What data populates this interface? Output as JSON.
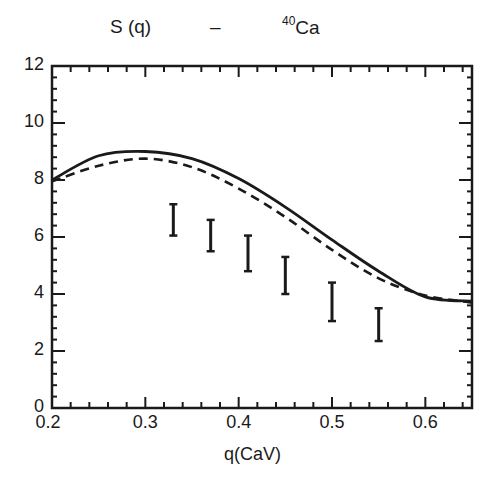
{
  "chart_data": {
    "type": "line",
    "title": "S (q)   –   40Ca",
    "title_parts": {
      "quantity": "S (q)",
      "dash": "–",
      "mass_number": "40",
      "element": "Ca"
    },
    "xlabel": "q(CaV)",
    "ylabel": "",
    "xlim": [
      0.2,
      0.65
    ],
    "ylim": [
      0,
      12
    ],
    "x_ticks": [
      "0.2",
      "0.3",
      "0.4",
      "0.5",
      "0.6"
    ],
    "y_ticks": [
      "0",
      "2",
      "4",
      "6",
      "8",
      "10",
      "12"
    ],
    "grid": false,
    "legend": "none",
    "series": [
      {
        "name": "solid curve",
        "style": "solid",
        "x": [
          0.2,
          0.25,
          0.3,
          0.35,
          0.4,
          0.45,
          0.5,
          0.55,
          0.6,
          0.65
        ],
        "values": [
          8.0,
          8.85,
          9.0,
          8.75,
          8.05,
          7.05,
          5.9,
          4.8,
          3.9,
          3.75
        ]
      },
      {
        "name": "dashed curve",
        "style": "dashed",
        "x": [
          0.2,
          0.25,
          0.3,
          0.35,
          0.4,
          0.45,
          0.5,
          0.55,
          0.6,
          0.65
        ],
        "values": [
          7.95,
          8.5,
          8.75,
          8.45,
          7.7,
          6.7,
          5.55,
          4.55,
          3.95,
          3.7
        ]
      },
      {
        "name": "data (error bars)",
        "style": "errorbar",
        "x": [
          0.33,
          0.37,
          0.41,
          0.45,
          0.5,
          0.55
        ],
        "low": [
          6.05,
          5.5,
          4.8,
          4.0,
          3.05,
          2.35
        ],
        "high": [
          7.15,
          6.6,
          6.05,
          5.3,
          4.4,
          3.5
        ]
      }
    ]
  },
  "colors": {
    "ink": "#1a1a1a",
    "background": "#ffffff"
  }
}
